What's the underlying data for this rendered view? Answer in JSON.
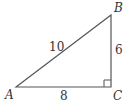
{
  "diagram": {
    "type": "right-triangle",
    "vertices": {
      "A": {
        "label": "A",
        "x": 16,
        "y": 87
      },
      "B": {
        "label": "B",
        "x": 111,
        "y": 15
      },
      "C": {
        "label": "C",
        "x": 111,
        "y": 87
      }
    },
    "sides": {
      "AB": {
        "label": "10"
      },
      "BC": {
        "label": "6"
      },
      "AC": {
        "label": "8"
      }
    },
    "right_angle_at": "C",
    "line_color": "#555555"
  }
}
